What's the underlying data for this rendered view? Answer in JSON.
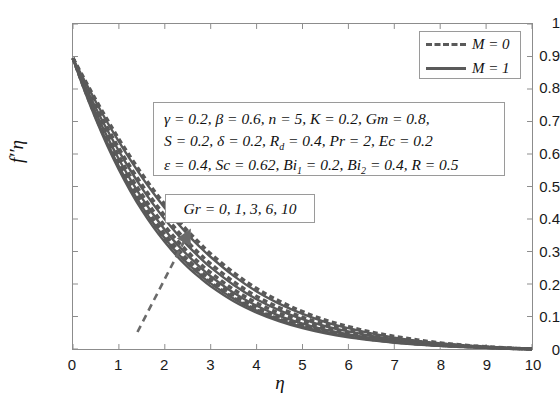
{
  "chart_data": {
    "type": "line",
    "title": "",
    "xlabel": "η",
    "ylabel": "f''(η)",
    "xlim": [
      0,
      10
    ],
    "ylim": [
      0,
      1
    ],
    "xticks": [
      "0",
      "1",
      "2",
      "3",
      "4",
      "5",
      "6",
      "7",
      "8",
      "9",
      "10"
    ],
    "yticks": [
      "0",
      "0.1",
      "0.2",
      "0.3",
      "0.4",
      "0.5",
      "0.6",
      "0.7",
      "0.8",
      "0.9",
      "1"
    ],
    "grid": false,
    "legend_position": "top-right",
    "legend": [
      {
        "label": "M = 0",
        "style": "dashed"
      },
      {
        "label": "M = 1",
        "style": "solid"
      }
    ],
    "annotations": [
      {
        "name": "parameter-box",
        "lines": [
          "γ = 0.2,  β = 0.6,  n = 5,  K = 0.2,  Gm = 0.8,",
          "S = 0.2,  δ = 0.2,  R_d = 0.4,  Pr = 2,  Ec = 0.2",
          "ε = 0.4,  Sc = 0.62,  Bi_1 = 0.2,  Bi_2 = 0.4,  R = 0.5"
        ]
      },
      {
        "name": "gr-box",
        "text": "Gr = 0, 1, 3, 6, 10"
      }
    ],
    "arrow": {
      "x1": 1.42,
      "y1": 0.055,
      "x2": 2.48,
      "y2": 0.345
    },
    "curve_color": "#595959",
    "parameter_varied": "Gr",
    "parameter_values": [
      0,
      1,
      3,
      6,
      10
    ],
    "series": [
      {
        "name": "Gr = 0, M = 0",
        "style": "dashed",
        "x": [
          0,
          0.25,
          0.5,
          0.75,
          1,
          1.25,
          1.5,
          1.75,
          2,
          2.25,
          2.5,
          2.75,
          3,
          3.5,
          4,
          4.5,
          5,
          5.5,
          6,
          6.5,
          7,
          7.5,
          8,
          8.5,
          9,
          9.5,
          10
        ],
        "y": [
          0.895,
          0.8,
          0.713,
          0.634,
          0.562,
          0.497,
          0.439,
          0.387,
          0.341,
          0.3,
          0.264,
          0.232,
          0.204,
          0.157,
          0.12,
          0.092,
          0.07,
          0.053,
          0.04,
          0.03,
          0.022,
          0.016,
          0.011,
          0.008,
          0.005,
          0.002,
          0.0
        ]
      },
      {
        "name": "Gr = 1, M = 0",
        "style": "dashed",
        "x": [
          0,
          0.25,
          0.5,
          0.75,
          1,
          1.25,
          1.5,
          1.75,
          2,
          2.25,
          2.5,
          2.75,
          3,
          3.5,
          4,
          4.5,
          5,
          5.5,
          6,
          6.5,
          7,
          7.5,
          8,
          8.5,
          9,
          9.5,
          10
        ],
        "y": [
          0.895,
          0.804,
          0.72,
          0.643,
          0.573,
          0.509,
          0.452,
          0.4,
          0.354,
          0.312,
          0.275,
          0.243,
          0.214,
          0.165,
          0.127,
          0.098,
          0.075,
          0.057,
          0.043,
          0.032,
          0.024,
          0.017,
          0.012,
          0.008,
          0.005,
          0.002,
          0.0
        ]
      },
      {
        "name": "Gr = 3, M = 0",
        "style": "dashed",
        "x": [
          0,
          0.25,
          0.5,
          0.75,
          1,
          1.25,
          1.5,
          1.75,
          2,
          2.25,
          2.5,
          2.75,
          3,
          3.5,
          4,
          4.5,
          5,
          5.5,
          6,
          6.5,
          7,
          7.5,
          8,
          8.5,
          9,
          9.5,
          10
        ],
        "y": [
          0.895,
          0.811,
          0.732,
          0.66,
          0.593,
          0.532,
          0.476,
          0.425,
          0.379,
          0.337,
          0.299,
          0.265,
          0.235,
          0.183,
          0.142,
          0.11,
          0.085,
          0.065,
          0.049,
          0.037,
          0.027,
          0.02,
          0.014,
          0.009,
          0.005,
          0.002,
          0.0
        ]
      },
      {
        "name": "Gr = 6, M = 0",
        "style": "dashed",
        "x": [
          0,
          0.25,
          0.5,
          0.75,
          1,
          1.25,
          1.5,
          1.75,
          2,
          2.25,
          2.5,
          2.75,
          3,
          3.5,
          4,
          4.5,
          5,
          5.5,
          6,
          6.5,
          7,
          7.5,
          8,
          8.5,
          9,
          9.5,
          10
        ],
        "y": [
          0.895,
          0.82,
          0.748,
          0.681,
          0.618,
          0.56,
          0.506,
          0.456,
          0.41,
          0.368,
          0.329,
          0.294,
          0.262,
          0.207,
          0.162,
          0.127,
          0.098,
          0.076,
          0.058,
          0.044,
          0.032,
          0.023,
          0.016,
          0.01,
          0.006,
          0.002,
          0.0
        ]
      },
      {
        "name": "Gr = 10, M = 0",
        "style": "dashed",
        "x": [
          0,
          0.25,
          0.5,
          0.75,
          1,
          1.25,
          1.5,
          1.75,
          2,
          2.25,
          2.5,
          2.75,
          3,
          3.5,
          4,
          4.5,
          5,
          5.5,
          6,
          6.5,
          7,
          7.5,
          8,
          8.5,
          9,
          9.5,
          10
        ],
        "y": [
          0.895,
          0.83,
          0.766,
          0.705,
          0.646,
          0.591,
          0.539,
          0.49,
          0.445,
          0.402,
          0.363,
          0.327,
          0.293,
          0.235,
          0.186,
          0.147,
          0.115,
          0.089,
          0.069,
          0.052,
          0.039,
          0.028,
          0.019,
          0.012,
          0.007,
          0.003,
          0.0
        ]
      },
      {
        "name": "Gr = 0, M = 1",
        "style": "solid",
        "x": [
          0,
          0.25,
          0.5,
          0.75,
          1,
          1.25,
          1.5,
          1.75,
          2,
          2.25,
          2.5,
          2.75,
          3,
          3.5,
          4,
          4.5,
          5,
          5.5,
          6,
          6.5,
          7,
          7.5,
          8,
          8.5,
          9,
          9.5,
          10
        ],
        "y": [
          0.893,
          0.795,
          0.706,
          0.625,
          0.552,
          0.486,
          0.427,
          0.375,
          0.329,
          0.288,
          0.252,
          0.221,
          0.193,
          0.147,
          0.112,
          0.085,
          0.064,
          0.048,
          0.036,
          0.027,
          0.019,
          0.014,
          0.01,
          0.006,
          0.004,
          0.002,
          0.0
        ]
      },
      {
        "name": "Gr = 1, M = 1",
        "style": "solid",
        "x": [
          0,
          0.25,
          0.5,
          0.75,
          1,
          1.25,
          1.5,
          1.75,
          2,
          2.25,
          2.5,
          2.75,
          3,
          3.5,
          4,
          4.5,
          5,
          5.5,
          6,
          6.5,
          7,
          7.5,
          8,
          8.5,
          9,
          9.5,
          10
        ],
        "y": [
          0.893,
          0.799,
          0.713,
          0.634,
          0.562,
          0.497,
          0.439,
          0.387,
          0.341,
          0.299,
          0.263,
          0.231,
          0.202,
          0.155,
          0.118,
          0.09,
          0.068,
          0.052,
          0.039,
          0.029,
          0.021,
          0.015,
          0.01,
          0.007,
          0.004,
          0.002,
          0.0
        ]
      },
      {
        "name": "Gr = 3, M = 1",
        "style": "solid",
        "x": [
          0,
          0.25,
          0.5,
          0.75,
          1,
          1.25,
          1.5,
          1.75,
          2,
          2.25,
          2.5,
          2.75,
          3,
          3.5,
          4,
          4.5,
          5,
          5.5,
          6,
          6.5,
          7,
          7.5,
          8,
          8.5,
          9,
          9.5,
          10
        ],
        "y": [
          0.893,
          0.806,
          0.726,
          0.652,
          0.584,
          0.522,
          0.465,
          0.414,
          0.367,
          0.325,
          0.288,
          0.254,
          0.224,
          0.173,
          0.133,
          0.102,
          0.078,
          0.059,
          0.045,
          0.033,
          0.024,
          0.017,
          0.012,
          0.008,
          0.005,
          0.002,
          0.0
        ]
      },
      {
        "name": "Gr = 6, M = 1",
        "style": "solid",
        "x": [
          0,
          0.25,
          0.5,
          0.75,
          1,
          1.25,
          1.5,
          1.75,
          2,
          2.25,
          2.5,
          2.75,
          3,
          3.5,
          4,
          4.5,
          5,
          5.5,
          6,
          6.5,
          7,
          7.5,
          8,
          8.5,
          9,
          9.5,
          10
        ],
        "y": [
          0.893,
          0.815,
          0.741,
          0.673,
          0.609,
          0.55,
          0.495,
          0.445,
          0.399,
          0.357,
          0.318,
          0.283,
          0.251,
          0.197,
          0.153,
          0.119,
          0.092,
          0.07,
          0.054,
          0.04,
          0.029,
          0.021,
          0.014,
          0.009,
          0.005,
          0.002,
          0.0
        ]
      },
      {
        "name": "Gr = 10, M = 1",
        "style": "solid",
        "x": [
          0,
          0.25,
          0.5,
          0.75,
          1,
          1.25,
          1.5,
          1.75,
          2,
          2.25,
          2.5,
          2.75,
          3,
          3.5,
          4,
          4.5,
          5,
          5.5,
          6,
          6.5,
          7,
          7.5,
          8,
          8.5,
          9,
          9.5,
          10
        ],
        "y": [
          0.893,
          0.826,
          0.76,
          0.697,
          0.638,
          0.582,
          0.529,
          0.48,
          0.434,
          0.392,
          0.352,
          0.316,
          0.283,
          0.225,
          0.177,
          0.139,
          0.108,
          0.083,
          0.064,
          0.048,
          0.035,
          0.025,
          0.017,
          0.011,
          0.006,
          0.003,
          0.0
        ]
      }
    ]
  }
}
